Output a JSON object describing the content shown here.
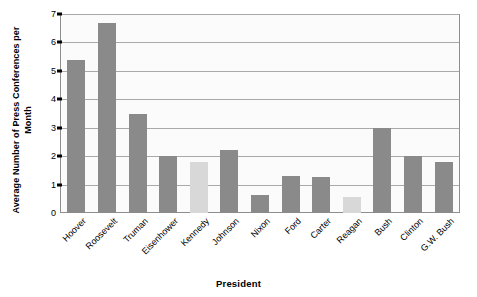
{
  "chart_data": {
    "type": "bar",
    "title": "",
    "xlabel": "President",
    "ylabel": "Average Number of Press Conferences per Month",
    "ylim": [
      0,
      7
    ],
    "yticks": [
      0,
      1,
      2,
      3,
      4,
      5,
      6,
      7
    ],
    "ytick_labels": [
      "0",
      "1",
      "2",
      "3",
      "4",
      "5",
      "6",
      "7"
    ],
    "grid": "horizontal",
    "legend": "none",
    "categories": [
      "Hoover",
      "Roosevelt",
      "Truman",
      "Eisenhower",
      "Kennedy",
      "Johnson",
      "Nixon",
      "Ford",
      "Carter",
      "Reagan",
      "Bush",
      "Clinton",
      "G.W. Bush"
    ],
    "values": [
      5.4,
      6.7,
      3.5,
      2.0,
      1.8,
      2.2,
      0.65,
      1.3,
      1.25,
      0.55,
      3.0,
      2.0,
      1.8
    ],
    "bar_colors": [
      "#8a8a8a",
      "#8a8a8a",
      "#8a8a8a",
      "#8a8a8a",
      "#d8d8d8",
      "#8a8a8a",
      "#8a8a8a",
      "#8a8a8a",
      "#8a8a8a",
      "#d8d8d8",
      "#8a8a8a",
      "#8a8a8a",
      "#8a8a8a"
    ],
    "colors": {
      "bar_dark": "#8a8a8a",
      "bar_light": "#d8d8d8",
      "gridline": "#a9a9a9",
      "axis": "#000000",
      "plot_background": "#fbfbfb",
      "plot_border": "#8e8e8e",
      "page_background": "#ffffff"
    }
  }
}
